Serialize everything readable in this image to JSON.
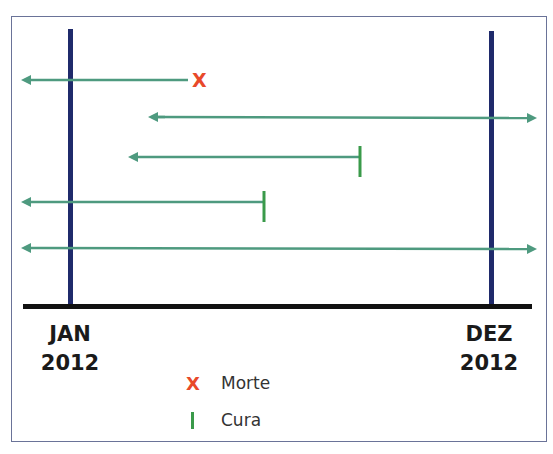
{
  "diagram": {
    "type": "timeline",
    "colors": {
      "frame": "#6a7398",
      "period_lines": "#1f2a6b",
      "axis": "#111111",
      "arrows": "#4e9a7f",
      "death_marker": "#e8492a",
      "cure_marker": "#3a9a4a"
    },
    "period_start": {
      "month": "JAN",
      "year": "2012"
    },
    "period_end": {
      "month": "DEZ",
      "year": "2012"
    },
    "cases": [
      {
        "start": "before",
        "end": "death",
        "end_marker": "X"
      },
      {
        "start": "during",
        "end": "after"
      },
      {
        "start": "during",
        "end": "cure",
        "end_marker": "|"
      },
      {
        "start": "before",
        "end": "cure",
        "end_marker": "|"
      },
      {
        "start": "before",
        "end": "after"
      }
    ],
    "legend": [
      {
        "symbol": "X",
        "label": "Morte"
      },
      {
        "symbol": "|",
        "label": "Cura"
      }
    ]
  }
}
